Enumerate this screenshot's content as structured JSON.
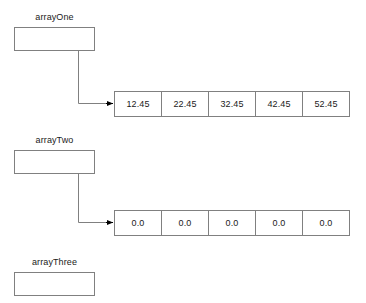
{
  "diagram": {
    "background_color": "#ffffff",
    "line_color": "#808080",
    "arrow_color": "#000000",
    "text_color": "#1a1a1a",
    "variables": [
      {
        "name": "arrayOne",
        "label": "arrayOne",
        "has_pointer": true,
        "array": {
          "values": [
            "12.45",
            "22.45",
            "32.45",
            "42.45",
            "52.45"
          ]
        }
      },
      {
        "name": "arrayTwo",
        "label": "arrayTwo",
        "has_pointer": true,
        "array": {
          "values": [
            "0.0",
            "0.0",
            "0.0",
            "0.0",
            "0.0"
          ]
        }
      },
      {
        "name": "arrayThree",
        "label": "arrayThree",
        "has_pointer": false,
        "array": null
      }
    ]
  }
}
